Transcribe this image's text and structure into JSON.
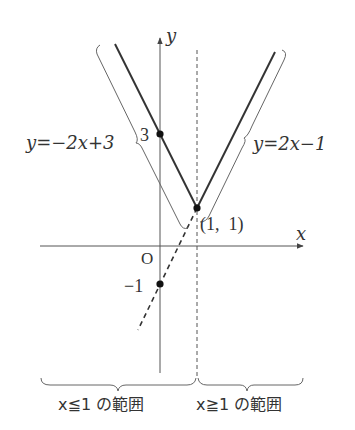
{
  "diagram": {
    "axes": {
      "x_label": "x",
      "y_label": "y",
      "origin_label": "O"
    },
    "functions": [
      {
        "label": "y=−2x+3",
        "domain": "x≦1",
        "style": "solid"
      },
      {
        "label": "y=2x−1",
        "domain": "x≧1",
        "style": "solid"
      },
      {
        "label": "y=2x−1 (extension)",
        "domain": "x≦1",
        "style": "dashed"
      }
    ],
    "points": [
      {
        "label": "3",
        "x": 0,
        "y": 3
      },
      {
        "label": "(1, 1)",
        "x": 1,
        "y": 1
      },
      {
        "label": "−1",
        "x": 0,
        "y": -1
      }
    ],
    "labels": {
      "left_line": "y=−2x+3",
      "right_line": "y=2x−1",
      "y_intercept_top": "3",
      "y_intercept_bottom": "−1",
      "vertex": "(1,  1)"
    },
    "ranges": [
      {
        "text": "x≦1 の範囲"
      },
      {
        "text": "x≧1 の範囲"
      }
    ],
    "colors": {
      "line": "#333333",
      "axis": "#555555",
      "brace": "#666666"
    }
  }
}
